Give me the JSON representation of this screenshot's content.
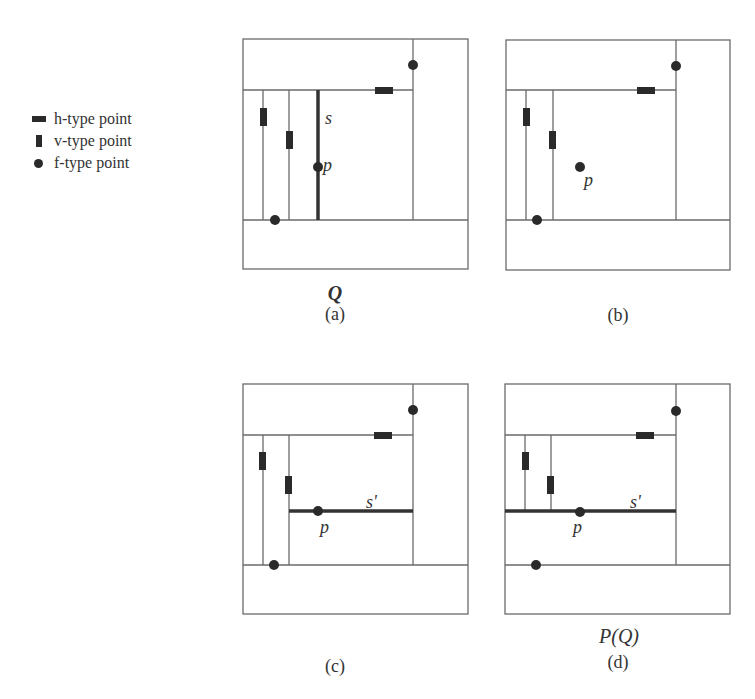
{
  "legend": {
    "items": [
      {
        "glyph": "h-type-marker",
        "label": "h-type point"
      },
      {
        "glyph": "v-type-marker",
        "label": "v-type point"
      },
      {
        "glyph": "f-type-marker",
        "label": "f-type point"
      }
    ]
  },
  "panels": [
    {
      "id": "a",
      "caption": "(a)",
      "title": "Q",
      "segment_label": "s",
      "point_label": "p",
      "segment_orientation": "vertical"
    },
    {
      "id": "b",
      "caption": "(b)",
      "title": "",
      "segment_label": "",
      "point_label": "p",
      "segment_orientation": "none"
    },
    {
      "id": "c",
      "caption": "(c)",
      "title": "",
      "segment_label": "s'",
      "point_label": "p",
      "segment_orientation": "horizontal"
    },
    {
      "id": "d",
      "caption": "(d)",
      "title": "P(Q)",
      "segment_label": "s'",
      "point_label": "p",
      "segment_orientation": "horizontal"
    }
  ],
  "colors": {
    "line": "#6a6a6a",
    "marker": "#2a2a2a",
    "segment": "#333333"
  }
}
